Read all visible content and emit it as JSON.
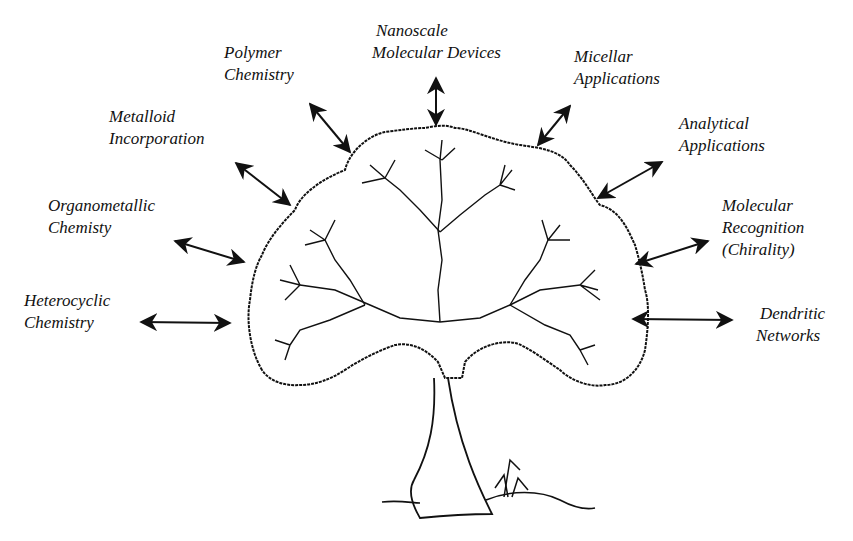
{
  "diagram": {
    "type": "dendrimer-tree",
    "central_element": "tree-with-dendritic-branches",
    "line_color": "#111111",
    "background": "#ffffff",
    "labels": [
      {
        "id": "nanoscale",
        "lines": [
          "Nanoscale",
          "Molecular Devices"
        ]
      },
      {
        "id": "polymer",
        "lines": [
          "Polymer",
          "Chemistry"
        ]
      },
      {
        "id": "micellar",
        "lines": [
          "Micellar",
          "Applications"
        ]
      },
      {
        "id": "metalloid",
        "lines": [
          "Metalloid",
          "Incorporation"
        ]
      },
      {
        "id": "analytical",
        "lines": [
          "Analytical",
          "Applications"
        ]
      },
      {
        "id": "organometallic",
        "lines": [
          "Organometallic",
          "Chemisty"
        ]
      },
      {
        "id": "molecular_recognition",
        "lines": [
          "Molecular",
          "Recognition",
          "(Chirality)"
        ]
      },
      {
        "id": "heterocyclic",
        "lines": [
          "Heterocyclic",
          "Chemistry"
        ]
      },
      {
        "id": "dendritic",
        "lines": [
          "Dendritic",
          "Networks"
        ]
      }
    ],
    "arrows": "double-headed, connecting each label to the tree crown"
  }
}
